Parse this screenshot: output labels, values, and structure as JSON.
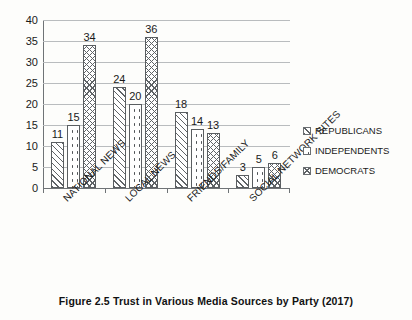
{
  "caption": "Figure 2.5  Trust in Various Media Sources by Party (2017)",
  "legend": {
    "position": "right",
    "items": [
      {
        "label": "REPUBLICANS",
        "pattern": "diagonal-hatch"
      },
      {
        "label": "INDEPENDENTS",
        "pattern": "dotted"
      },
      {
        "label": "DEMOCRATS",
        "pattern": "cross-hatch"
      }
    ]
  },
  "axis": {
    "y_ticks": [
      "0",
      "5",
      "10",
      "15",
      "20",
      "25",
      "30",
      "35",
      "40"
    ]
  },
  "chart_data": {
    "type": "bar",
    "title": "Figure 2.5  Trust in Various Media Sources by Party (2017)",
    "xlabel": "",
    "ylabel": "",
    "ylim": [
      0,
      40
    ],
    "ytick_step": 5,
    "grid": true,
    "legend_position": "right",
    "categories": [
      "NATIONAL NEWS",
      "LOCAL NEWS",
      "FRIENDS/FAMILY",
      "SOCIAL NETWORK SITES"
    ],
    "series": [
      {
        "name": "REPUBLICANS",
        "values": [
          11,
          24,
          18,
          3
        ]
      },
      {
        "name": "INDEPENDENTS",
        "values": [
          15,
          20,
          14,
          5
        ]
      },
      {
        "name": "DEMOCRATS",
        "values": [
          34,
          36,
          13,
          6
        ]
      }
    ],
    "data_labels": [
      [
        "11",
        "15",
        "34"
      ],
      [
        "24",
        "20",
        "36"
      ],
      [
        "18",
        "14",
        "13"
      ],
      [
        "3",
        "5",
        "6"
      ]
    ]
  }
}
